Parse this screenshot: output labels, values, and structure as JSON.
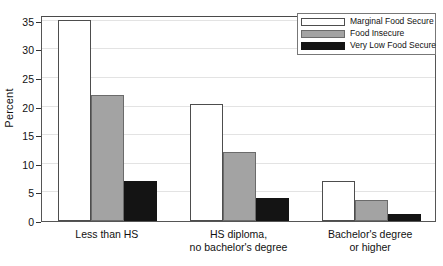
{
  "chart_data": {
    "type": "bar",
    "title": "",
    "subtitle": "",
    "xlabel": "",
    "ylabel": "Percent",
    "ylim": [
      0,
      36
    ],
    "yticks": [
      0,
      5,
      10,
      15,
      20,
      25,
      30,
      35
    ],
    "ytick_labels": [
      "0",
      "5",
      "10",
      "15",
      "20",
      "25",
      "30",
      "35"
    ],
    "grid": true,
    "legend_position": "top-right",
    "categories": [
      "Less than HS",
      "HS diploma,\nno bachelor's degree",
      "Bachelor's degree\nor higher"
    ],
    "category_lines": [
      [
        "Less than HS"
      ],
      [
        "HS diploma,",
        "no bachelor's degree"
      ],
      [
        "Bachelor's degree",
        "or higher"
      ]
    ],
    "series": [
      {
        "name": "Marginal Food Secure",
        "color": "#ffffff",
        "edge_color": "#4d4d4d",
        "values": [
          35.2,
          20.4,
          7.0
        ]
      },
      {
        "name": "Food Insecure",
        "color": "#a3a3a3",
        "edge_color": "#6b6b6b",
        "values": [
          22.0,
          12.0,
          3.6
        ]
      },
      {
        "name": "Very Low Food Secure",
        "color": "#141414",
        "edge_color": "#141414",
        "values": [
          7.0,
          4.0,
          1.2
        ]
      }
    ]
  },
  "legend": {
    "items": [
      {
        "label": "Marginal Food Secure",
        "swatch": "white"
      },
      {
        "label": "Food Insecure",
        "swatch": "gray"
      },
      {
        "label": "Very Low Food Secure",
        "swatch": "black"
      }
    ]
  }
}
